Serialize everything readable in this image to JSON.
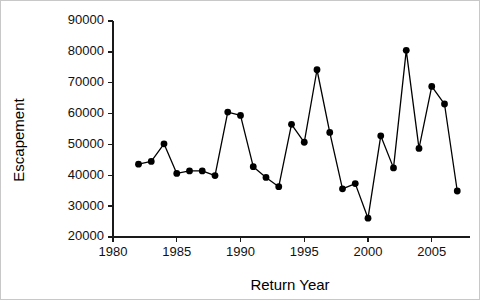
{
  "chart_data": {
    "type": "line",
    "title": "",
    "xlabel": "Return Year",
    "ylabel": "Escapement",
    "xlim": [
      1980,
      2008
    ],
    "ylim": [
      20000,
      90000
    ],
    "xticks": [
      1980,
      1985,
      1990,
      1995,
      2000,
      2005
    ],
    "xtick_labels": [
      "1980",
      "1985",
      "1990",
      "1995",
      "2000",
      "2005"
    ],
    "yticks": [
      20000,
      30000,
      40000,
      50000,
      60000,
      70000,
      80000,
      90000
    ],
    "ytick_labels": [
      "20000",
      "30000",
      "40000",
      "50000",
      "60000",
      "70000",
      "80000",
      "90000"
    ],
    "grid": false,
    "legend": false,
    "legend_position": "none",
    "marker": "filled-circle",
    "marker_color": "#000000",
    "line_color": "#000000",
    "x": [
      1982,
      1983,
      1984,
      1985,
      1986,
      1987,
      1988,
      1989,
      1990,
      1991,
      1992,
      1993,
      1994,
      1995,
      1996,
      1997,
      1998,
      1999,
      2000,
      2001,
      2002,
      2003,
      2004,
      2005,
      2006,
      2007
    ],
    "values": [
      43600,
      44500,
      50200,
      40600,
      41400,
      41400,
      39900,
      60500,
      59400,
      42800,
      39300,
      36300,
      56500,
      50700,
      74200,
      53900,
      35600,
      37300,
      26100,
      52800,
      42400,
      80500,
      48700,
      68800,
      63100,
      34900
    ],
    "series": [
      {
        "name": "Escapement",
        "values": [
          43600,
          44500,
          50200,
          40600,
          41400,
          41400,
          39900,
          60500,
          59400,
          42800,
          39300,
          36300,
          56500,
          50700,
          74200,
          53900,
          35600,
          37300,
          26100,
          52800,
          42400,
          80500,
          48700,
          68800,
          63100,
          34900
        ]
      }
    ]
  }
}
